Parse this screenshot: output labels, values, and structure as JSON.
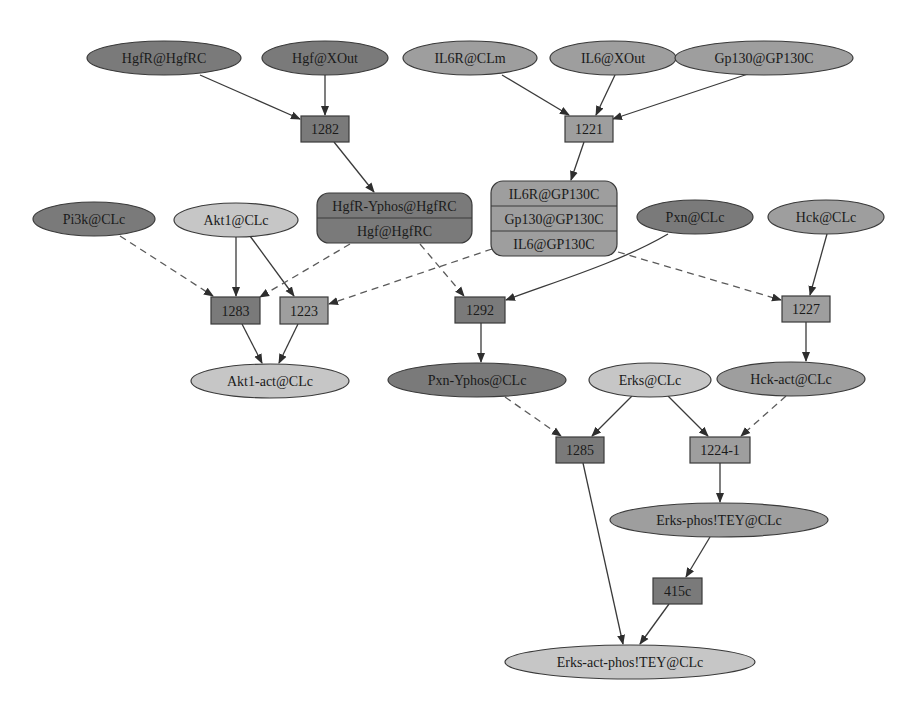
{
  "diagram": {
    "palette": {
      "dark": "#7a7a7a",
      "medium": "#9e9e9e",
      "light": "#c6c6c6",
      "stroke": "#3a3a3a",
      "background": "#ffffff"
    },
    "species": [
      {
        "id": "HgfR_HgfRC",
        "label": "HgfR@HgfRC",
        "shape": "ellipse",
        "tone": "dark",
        "cx": 164,
        "cy": 58,
        "rx": 77,
        "ry": 17
      },
      {
        "id": "Hgf_XOut",
        "label": "Hgf@XOut",
        "shape": "ellipse",
        "tone": "dark",
        "cx": 325,
        "cy": 58,
        "rx": 63,
        "ry": 17
      },
      {
        "id": "IL6R_CLm",
        "label": "IL6R@CLm",
        "shape": "ellipse",
        "tone": "medium",
        "cx": 470,
        "cy": 58,
        "rx": 67,
        "ry": 17
      },
      {
        "id": "IL6_XOut",
        "label": "IL6@XOut",
        "shape": "ellipse",
        "tone": "medium",
        "cx": 613,
        "cy": 58,
        "rx": 63,
        "ry": 17
      },
      {
        "id": "Gp130_GP130C",
        "label": "Gp130@GP130C",
        "shape": "ellipse",
        "tone": "medium",
        "cx": 764,
        "cy": 58,
        "rx": 89,
        "ry": 17
      },
      {
        "id": "Pi3k_CLc",
        "label": "Pi3k@CLc",
        "shape": "ellipse",
        "tone": "dark",
        "cx": 94,
        "cy": 219,
        "rx": 61,
        "ry": 17
      },
      {
        "id": "Akt1_CLc",
        "label": "Akt1@CLc",
        "shape": "ellipse",
        "tone": "light",
        "cx": 236,
        "cy": 220,
        "rx": 62,
        "ry": 17
      },
      {
        "id": "Pxn_CLc",
        "label": "Pxn@CLc",
        "shape": "ellipse",
        "tone": "dark",
        "cx": 695,
        "cy": 217,
        "rx": 58,
        "ry": 17
      },
      {
        "id": "Hck_CLc",
        "label": "Hck@CLc",
        "shape": "ellipse",
        "tone": "medium",
        "cx": 826,
        "cy": 217,
        "rx": 58,
        "ry": 17
      },
      {
        "id": "Akt1act_CLc",
        "label": "Akt1-act@CLc",
        "shape": "ellipse",
        "tone": "light",
        "cx": 270,
        "cy": 381,
        "rx": 79,
        "ry": 17
      },
      {
        "id": "PxnYphos_CLc",
        "label": "Pxn-Yphos@CLc",
        "shape": "ellipse",
        "tone": "dark",
        "cx": 477,
        "cy": 380,
        "rx": 89,
        "ry": 17
      },
      {
        "id": "Erks_CLc",
        "label": "Erks@CLc",
        "shape": "ellipse",
        "tone": "light",
        "cx": 650,
        "cy": 380,
        "rx": 61,
        "ry": 17
      },
      {
        "id": "Hckact_CLc",
        "label": "Hck-act@CLc",
        "shape": "ellipse",
        "tone": "medium",
        "cx": 791,
        "cy": 379,
        "rx": 74,
        "ry": 17
      },
      {
        "id": "ErksPhos_CLc",
        "label": "Erks-phos!TEY@CLc",
        "shape": "ellipse",
        "tone": "medium",
        "cx": 719,
        "cy": 520,
        "rx": 109,
        "ry": 17
      },
      {
        "id": "ErksActPhos_CLc",
        "label": "Erks-act-phos!TEY@CLc",
        "shape": "ellipse",
        "tone": "light",
        "cx": 630,
        "cy": 662,
        "rx": 125,
        "ry": 17
      }
    ],
    "complexes": [
      {
        "id": "HgfR_complex",
        "tone": "dark",
        "x": 317,
        "y": 193,
        "w": 155,
        "h": 50,
        "rows": [
          "HgfR-Yphos@HgfRC",
          "Hgf@HgfRC"
        ]
      },
      {
        "id": "IL6_complex",
        "tone": "medium",
        "x": 491,
        "y": 181,
        "w": 126,
        "h": 75,
        "rows": [
          "IL6R@GP130C",
          "Gp130@GP130C",
          "IL6@GP130C"
        ]
      }
    ],
    "reactions": [
      {
        "id": "r1282",
        "label": "1282",
        "tone": "dark",
        "x": 301,
        "y": 116,
        "w": 48,
        "h": 26
      },
      {
        "id": "r1221",
        "label": "1221",
        "tone": "medium",
        "x": 565,
        "y": 116,
        "w": 48,
        "h": 26
      },
      {
        "id": "r1283",
        "label": "1283",
        "tone": "dark",
        "x": 211,
        "y": 297,
        "w": 49,
        "h": 27
      },
      {
        "id": "r1223",
        "label": "1223",
        "tone": "medium",
        "x": 280,
        "y": 297,
        "w": 48,
        "h": 27
      },
      {
        "id": "r1292",
        "label": "1292",
        "tone": "dark",
        "x": 455,
        "y": 297,
        "w": 50,
        "h": 26
      },
      {
        "id": "r1227",
        "label": "1227",
        "tone": "medium",
        "x": 782,
        "y": 296,
        "w": 48,
        "h": 26
      },
      {
        "id": "r1285",
        "label": "1285",
        "tone": "dark",
        "x": 556,
        "y": 437,
        "w": 48,
        "h": 26
      },
      {
        "id": "r1224_1",
        "label": "1224-1",
        "tone": "medium",
        "x": 690,
        "y": 437,
        "w": 60,
        "h": 26
      },
      {
        "id": "r415c",
        "label": "415c",
        "tone": "dark",
        "x": 653,
        "y": 578,
        "w": 49,
        "h": 26
      }
    ],
    "edges": [
      {
        "from": "HgfR@HgfRC",
        "to": "1282",
        "style": "solid",
        "path": "M200,75 L300,119"
      },
      {
        "from": "Hgf@XOut",
        "to": "1282",
        "style": "solid",
        "path": "M325,75 L325,115"
      },
      {
        "from": "1282",
        "to": "HgfR-Yphos complex",
        "style": "solid",
        "path": "M334,142 L374,192"
      },
      {
        "from": "IL6R@CLm",
        "to": "1221",
        "style": "solid",
        "path": "M502,75 L569,115"
      },
      {
        "from": "IL6@XOut",
        "to": "1221",
        "style": "solid",
        "path": "M615,75 L596,115"
      },
      {
        "from": "Gp130@GP130C",
        "to": "1221",
        "style": "solid",
        "path": "M748,74 L613,119"
      },
      {
        "from": "1221",
        "to": "IL6 complex",
        "style": "solid",
        "path": "M584,142 L571,180"
      },
      {
        "from": "Pi3k@CLc",
        "to": "1283",
        "style": "dashed",
        "path": "M120,236 L213,296"
      },
      {
        "from": "Akt1@CLc",
        "to": "1283",
        "style": "solid",
        "path": "M236,237 L236,296"
      },
      {
        "from": "Akt1@CLc",
        "to": "1223",
        "style": "solid",
        "path": "M250,236 L294,296"
      },
      {
        "from": "HgfR complex",
        "to": "1283",
        "style": "dashed",
        "path": "M350,244 L260,297"
      },
      {
        "from": "IL6 complex",
        "to": "1223",
        "style": "dashed",
        "path": "M492,249 L329,304"
      },
      {
        "from": "HgfR complex",
        "to": "1292",
        "style": "dashed",
        "path": "M420,244 L464,296"
      },
      {
        "from": "Pxn@CLc",
        "to": "1292",
        "style": "solid",
        "path": "M668,234 C620,262 560,280 506,300"
      },
      {
        "from": "IL6 complex",
        "to": "1227",
        "style": "dashed",
        "path": "M618,252 L781,300"
      },
      {
        "from": "Hck@CLc",
        "to": "1227",
        "style": "solid",
        "path": "M827,234 L810,295"
      },
      {
        "from": "1283",
        "to": "Akt1-act@CLc",
        "style": "solid",
        "path": "M242,324 L262,363"
      },
      {
        "from": "1223",
        "to": "Akt1-act@CLc",
        "style": "solid",
        "path": "M298,324 L279,363"
      },
      {
        "from": "1292",
        "to": "Pxn-Yphos@CLc",
        "style": "solid",
        "path": "M481,323 L481,362"
      },
      {
        "from": "1227",
        "to": "Hck-act@CLc",
        "style": "solid",
        "path": "M806,322 L806,361"
      },
      {
        "from": "Pxn-Yphos@CLc",
        "to": "1285",
        "style": "dashed",
        "path": "M505,397 L561,436"
      },
      {
        "from": "Erks@CLc",
        "to": "1285",
        "style": "solid",
        "path": "M632,396 L592,436"
      },
      {
        "from": "Erks@CLc",
        "to": "1224-1",
        "style": "solid",
        "path": "M668,396 L708,436"
      },
      {
        "from": "Hck-act@CLc",
        "to": "1224-1",
        "style": "dashed",
        "path": "M786,396 L741,436"
      },
      {
        "from": "1224-1",
        "to": "Erks-phos!TEY@CLc",
        "style": "solid",
        "path": "M720,463 L720,502"
      },
      {
        "from": "1285",
        "to": "Erks-act-phos!TEY@CLc",
        "style": "solid",
        "path": "M583,463 L623,644"
      },
      {
        "from": "Erks-phos!TEY@CLc",
        "to": "415c",
        "style": "solid",
        "path": "M710,537 L686,577"
      },
      {
        "from": "415c",
        "to": "Erks-act-phos!TEY@CLc",
        "style": "solid",
        "path": "M669,604 L640,644"
      }
    ]
  }
}
